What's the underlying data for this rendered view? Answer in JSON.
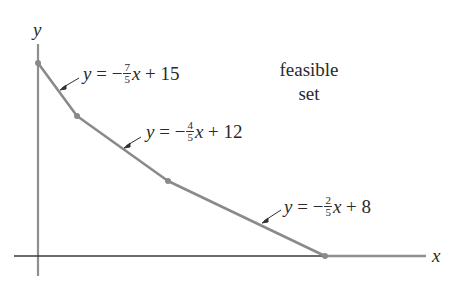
{
  "diagram": {
    "axes": {
      "x_label": "x",
      "y_label": "y"
    },
    "region_label": {
      "line1": "feasible",
      "line2": "set"
    },
    "boundary_vertices": [
      [
        38,
        63
      ],
      [
        77,
        116
      ],
      [
        168,
        181
      ],
      [
        325,
        256
      ]
    ],
    "equations": [
      {
        "lhs": "y",
        "eq": "=",
        "sign": "−",
        "num": "7",
        "den": "5",
        "var": "x",
        "plus": "+",
        "const": "15"
      },
      {
        "lhs": "y",
        "eq": "=",
        "sign": "−",
        "num": "4",
        "den": "5",
        "var": "x",
        "plus": "+",
        "const": "12"
      },
      {
        "lhs": "y",
        "eq": "=",
        "sign": "−",
        "num": "2",
        "den": "5",
        "var": "x",
        "plus": "+",
        "const": "8"
      }
    ],
    "colors": {
      "boundary": "#8a8a8a",
      "axis": "#3a3a3a",
      "text": "#2a2a2a"
    }
  }
}
